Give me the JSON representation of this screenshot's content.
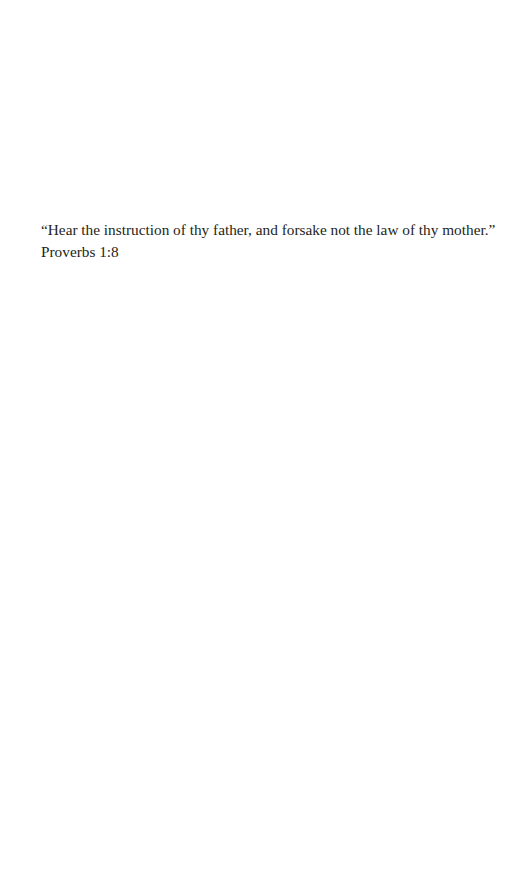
{
  "epigraph": {
    "quote": "“Hear the instruction of thy father, and forsake not the law of thy mother.”",
    "citation": "Proverbs 1:8"
  }
}
